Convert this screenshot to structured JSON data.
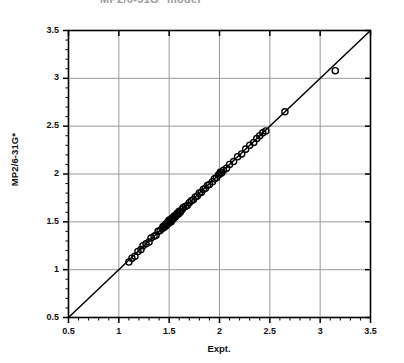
{
  "chart_data": {
    "type": "scatter",
    "title": "MP2/6-31G* model",
    "xlabel": "Expt.",
    "ylabel": "MP2/6-31G*",
    "xlim": [
      0.5,
      3.5
    ],
    "ylim": [
      0.5,
      3.5
    ],
    "xticks": [
      "0.5",
      "1",
      "1.5",
      "2",
      "2.5",
      "3",
      "3.5"
    ],
    "yticks": [
      "0.5",
      "1",
      "1.5",
      "2",
      "2.5",
      "3",
      "3.5"
    ],
    "xtick_values": [
      0.5,
      1,
      1.5,
      2,
      2.5,
      3,
      3.5
    ],
    "ytick_values": [
      0.5,
      1,
      1.5,
      2,
      2.5,
      3,
      3.5
    ],
    "minor_tick_step": 0.1,
    "grid": true,
    "legend": null,
    "marker": "open-circle",
    "marker_color": "#000000",
    "reference_line": {
      "label": "y = x",
      "from": [
        0.5,
        0.5
      ],
      "to": [
        3.5,
        3.5
      ],
      "color": "#000000"
    },
    "points": [
      [
        1.1,
        1.08
      ],
      [
        1.13,
        1.12
      ],
      [
        1.16,
        1.14
      ],
      [
        1.19,
        1.19
      ],
      [
        1.22,
        1.21
      ],
      [
        1.24,
        1.25
      ],
      [
        1.27,
        1.27
      ],
      [
        1.3,
        1.29
      ],
      [
        1.32,
        1.33
      ],
      [
        1.35,
        1.35
      ],
      [
        1.37,
        1.36
      ],
      [
        1.39,
        1.4
      ],
      [
        1.41,
        1.41
      ],
      [
        1.43,
        1.43
      ],
      [
        1.44,
        1.45
      ],
      [
        1.45,
        1.44
      ],
      [
        1.46,
        1.47
      ],
      [
        1.47,
        1.46
      ],
      [
        1.48,
        1.49
      ],
      [
        1.49,
        1.48
      ],
      [
        1.5,
        1.5
      ],
      [
        1.5,
        1.52
      ],
      [
        1.51,
        1.51
      ],
      [
        1.52,
        1.5
      ],
      [
        1.53,
        1.54
      ],
      [
        1.54,
        1.53
      ],
      [
        1.55,
        1.56
      ],
      [
        1.56,
        1.55
      ],
      [
        1.57,
        1.57
      ],
      [
        1.58,
        1.59
      ],
      [
        1.59,
        1.58
      ],
      [
        1.6,
        1.61
      ],
      [
        1.61,
        1.6
      ],
      [
        1.63,
        1.63
      ],
      [
        1.64,
        1.65
      ],
      [
        1.66,
        1.66
      ],
      [
        1.68,
        1.67
      ],
      [
        1.7,
        1.7
      ],
      [
        1.72,
        1.72
      ],
      [
        1.74,
        1.73
      ],
      [
        1.76,
        1.76
      ],
      [
        1.78,
        1.77
      ],
      [
        1.8,
        1.8
      ],
      [
        1.82,
        1.81
      ],
      [
        1.84,
        1.84
      ],
      [
        1.86,
        1.85
      ],
      [
        1.88,
        1.88
      ],
      [
        1.9,
        1.89
      ],
      [
        1.93,
        1.92
      ],
      [
        1.95,
        1.95
      ],
      [
        1.97,
        1.96
      ],
      [
        1.99,
        1.99
      ],
      [
        2.0,
        2.0
      ],
      [
        2.01,
        2.02
      ],
      [
        2.02,
        2.01
      ],
      [
        2.04,
        2.04
      ],
      [
        2.07,
        2.06
      ],
      [
        2.1,
        2.1
      ],
      [
        2.14,
        2.13
      ],
      [
        2.18,
        2.18
      ],
      [
        2.22,
        2.21
      ],
      [
        2.26,
        2.26
      ],
      [
        2.3,
        2.3
      ],
      [
        2.34,
        2.33
      ],
      [
        2.37,
        2.37
      ],
      [
        2.4,
        2.4
      ],
      [
        2.43,
        2.43
      ],
      [
        2.46,
        2.45
      ],
      [
        2.65,
        2.65
      ],
      [
        3.15,
        3.08
      ]
    ]
  },
  "axes": {
    "frame_color": "#000000",
    "grid_color": "#9a9a9a"
  }
}
